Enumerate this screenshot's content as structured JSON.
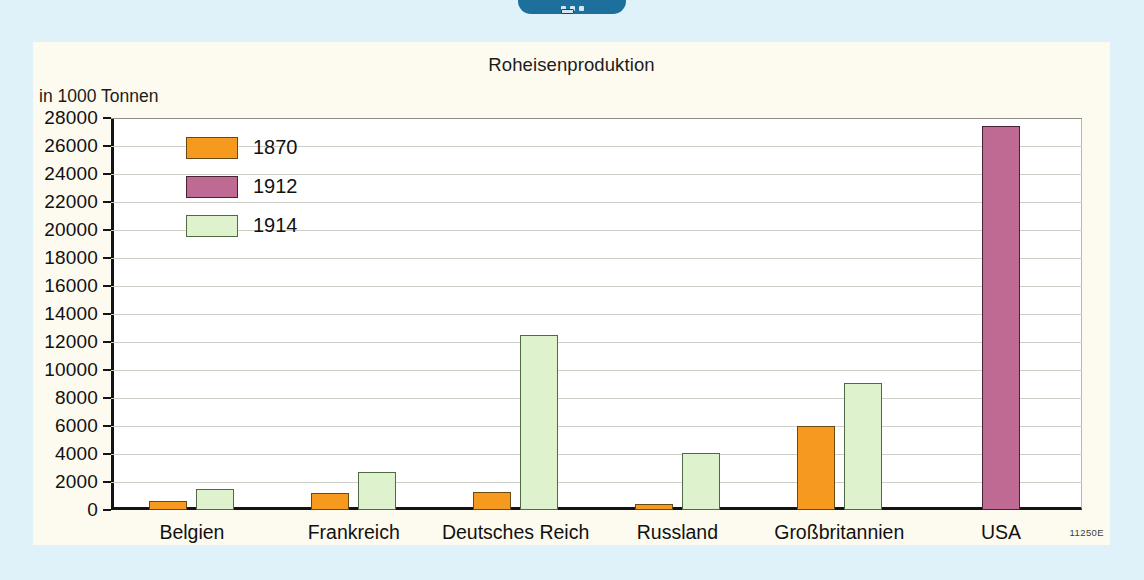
{
  "badge": {
    "icon": "menu-dots-badge"
  },
  "card": {
    "source_code": "11250E"
  },
  "chart_data": {
    "type": "bar",
    "title": "Roheisenproduktion",
    "ylabel": "in 1000 Tonnen",
    "xlabel": "",
    "ylim": [
      0,
      28000
    ],
    "ytick_step": 2000,
    "grid": true,
    "legend_position": "inside-top-left",
    "yticks": [
      "28000",
      "26000",
      "24000",
      "22000",
      "20000",
      "18000",
      "16000",
      "14000",
      "12000",
      "10000",
      "8000",
      "6000",
      "4000",
      "2000",
      "0"
    ],
    "categories": [
      "Belgien",
      "Frankreich",
      "Deutsches Reich",
      "Russland",
      "Großbritannien",
      "USA"
    ],
    "series": [
      {
        "name": "1870",
        "color": "#f59a1e",
        "values": [
          650,
          1200,
          1300,
          400,
          6000,
          null
        ]
      },
      {
        "name": "1912",
        "color": "#bf6a93",
        "values": [
          null,
          null,
          null,
          null,
          null,
          27400
        ]
      },
      {
        "name": "1914",
        "color": "#ddf2cd",
        "values": [
          1500,
          2700,
          12500,
          4100,
          9100,
          null
        ]
      }
    ]
  }
}
